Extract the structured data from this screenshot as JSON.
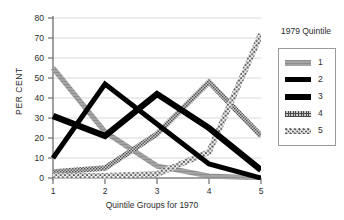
{
  "chart_data": {
    "type": "line",
    "title": "",
    "xlabel": "Quintile Groups for 1970",
    "ylabel": "PER CENT",
    "x": [
      1,
      2,
      3,
      4,
      5
    ],
    "xtick_labels": [
      "1",
      "2",
      "3",
      "4",
      "5"
    ],
    "ytick_labels": [
      "0",
      "10",
      "20",
      "30",
      "40",
      "50",
      "60",
      "70",
      "80"
    ],
    "yticks": [
      0,
      10,
      20,
      30,
      40,
      50,
      60,
      70,
      80
    ],
    "ylim": [
      0,
      80
    ],
    "xlim": [
      1,
      5
    ],
    "grid": "horizontal",
    "legend_position": "right",
    "legend_title": "1979 Quintile",
    "series": [
      {
        "name": "1",
        "values": [
          55,
          23,
          6,
          1,
          0
        ],
        "color": "#9d9d9d",
        "style": "solid-gray"
      },
      {
        "name": "2",
        "values": [
          10,
          47,
          27,
          7,
          0
        ],
        "color": "#000000",
        "style": "solid-black"
      },
      {
        "name": "3",
        "values": [
          31,
          21,
          42,
          25,
          4
        ],
        "color": "#000000",
        "style": "solid-black-thick"
      },
      {
        "name": "4",
        "values": [
          3,
          5,
          22,
          48,
          21
        ],
        "color": "#b4b4b4",
        "style": "fine-hatch"
      },
      {
        "name": "5",
        "values": [
          1,
          1,
          2,
          13,
          72
        ],
        "color": "#cfcfcf",
        "style": "coarse-dot"
      }
    ]
  },
  "legend": {
    "title": "1979 Quintile",
    "items": [
      {
        "label": "1"
      },
      {
        "label": "2"
      },
      {
        "label": "3"
      },
      {
        "label": "4"
      },
      {
        "label": "5"
      }
    ]
  },
  "axes": {
    "y_title": "PER CENT",
    "x_title": "Quintile Groups for 1970"
  },
  "colors": {
    "axis": "#8a8a8a",
    "grid": "#d8d8d8",
    "text": "#2b2b2b",
    "series1": "#9d9d9d",
    "series2": "#000000",
    "series3": "#000000",
    "series4": "#b4b4b4",
    "series5": "#cfcfcf"
  }
}
